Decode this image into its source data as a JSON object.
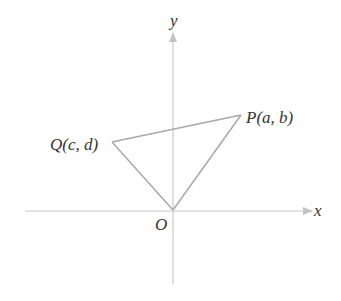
{
  "diagram": {
    "type": "coordinate-plane-triangle",
    "axes": {
      "x_label": "x",
      "y_label": "y",
      "origin_label": "O",
      "color": "#c4c4c4"
    },
    "points": [
      {
        "id": "P",
        "label": "P(a, b)",
        "coords": [
          "a",
          "b"
        ]
      },
      {
        "id": "Q",
        "label": "Q(c, d)",
        "coords": [
          "c",
          "d"
        ]
      },
      {
        "id": "O",
        "label": "O",
        "coords": [
          0,
          0
        ]
      }
    ],
    "segments": [
      {
        "from": "O",
        "to": "P"
      },
      {
        "from": "P",
        "to": "Q"
      },
      {
        "from": "Q",
        "to": "O"
      }
    ],
    "line_color": "#a8a8a8",
    "text_color": "#333333"
  }
}
